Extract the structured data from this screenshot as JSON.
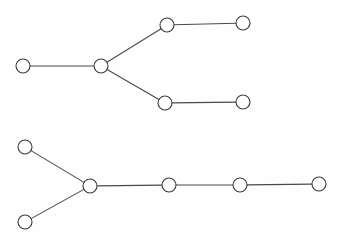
{
  "figure": {
    "width": 352,
    "height": 236,
    "background_color": "#fefefe",
    "node_fill_color": "#ffffff",
    "node_stroke_color": "#3a3a3a",
    "edge_stroke_color": "#4a4a4a",
    "node_radius": 7,
    "node_stroke_width": 1.1,
    "edge_stroke_width": 1.1
  },
  "chart_data": {
    "type": "diagram",
    "diagram_type": "node-link-graph",
    "title": "",
    "xlabel": "",
    "ylabel": "",
    "grid": false,
    "legend": null,
    "annotations": [],
    "graphs": [
      {
        "id": "graph-top",
        "name": "top-tree",
        "node_count": 6,
        "edge_count": 5,
        "nodes": [
          {
            "id": "t0",
            "label": "",
            "x": 23,
            "y": 66,
            "degree": 1
          },
          {
            "id": "t1",
            "label": "",
            "x": 101,
            "y": 66,
            "degree": 3
          },
          {
            "id": "t2",
            "label": "",
            "x": 167,
            "y": 25,
            "degree": 2
          },
          {
            "id": "t3",
            "label": "",
            "x": 243,
            "y": 23,
            "degree": 1
          },
          {
            "id": "t4",
            "label": "",
            "x": 165,
            "y": 103,
            "degree": 2
          },
          {
            "id": "t5",
            "label": "",
            "x": 243,
            "y": 102,
            "degree": 1
          }
        ],
        "edges": [
          {
            "source": "t0",
            "target": "t1"
          },
          {
            "source": "t1",
            "target": "t2"
          },
          {
            "source": "t2",
            "target": "t3"
          },
          {
            "source": "t1",
            "target": "t4"
          },
          {
            "source": "t4",
            "target": "t5"
          }
        ]
      },
      {
        "id": "graph-bottom",
        "name": "bottom-tree",
        "node_count": 7,
        "edge_count": 6,
        "nodes": [
          {
            "id": "b0",
            "label": "",
            "x": 25,
            "y": 147,
            "degree": 1
          },
          {
            "id": "b1",
            "label": "",
            "x": 25,
            "y": 222,
            "degree": 1
          },
          {
            "id": "b2",
            "label": "",
            "x": 90,
            "y": 186,
            "degree": 3
          },
          {
            "id": "b3",
            "label": "",
            "x": 169,
            "y": 185,
            "degree": 2
          },
          {
            "id": "b4",
            "label": "",
            "x": 240,
            "y": 185,
            "degree": 2
          },
          {
            "id": "b5",
            "label": "",
            "x": 319,
            "y": 184,
            "degree": 1
          }
        ],
        "edges": [
          {
            "source": "b0",
            "target": "b2"
          },
          {
            "source": "b1",
            "target": "b2"
          },
          {
            "source": "b2",
            "target": "b3"
          },
          {
            "source": "b3",
            "target": "b4"
          },
          {
            "source": "b4",
            "target": "b5"
          }
        ]
      }
    ]
  }
}
